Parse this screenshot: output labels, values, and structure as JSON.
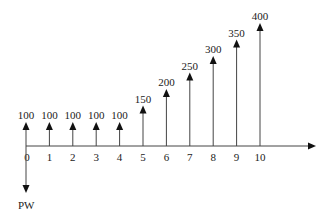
{
  "chart_data": {
    "type": "cash-flow-diagram",
    "title": "",
    "periods": [
      0,
      1,
      2,
      3,
      4,
      5,
      6,
      7,
      8,
      9,
      10
    ],
    "cash_flows": [
      {
        "period": 0,
        "value": 100,
        "direction": "up"
      },
      {
        "period": 1,
        "value": 100,
        "direction": "up"
      },
      {
        "period": 2,
        "value": 100,
        "direction": "up"
      },
      {
        "period": 3,
        "value": 100,
        "direction": "up"
      },
      {
        "period": 4,
        "value": 100,
        "direction": "up"
      },
      {
        "period": 5,
        "value": 150,
        "direction": "up"
      },
      {
        "period": 6,
        "value": 200,
        "direction": "up"
      },
      {
        "period": 7,
        "value": 250,
        "direction": "up"
      },
      {
        "period": 8,
        "value": 300,
        "direction": "up"
      },
      {
        "period": 9,
        "value": 350,
        "direction": "up"
      },
      {
        "period": 10,
        "value": 400,
        "direction": "up"
      }
    ],
    "present_worth": {
      "period": 0,
      "label": "PW",
      "direction": "down"
    },
    "xlabel": "",
    "ylabel": ""
  },
  "colors": {
    "line": "#444444",
    "arrowhead": "#111111",
    "text": "#222222"
  }
}
